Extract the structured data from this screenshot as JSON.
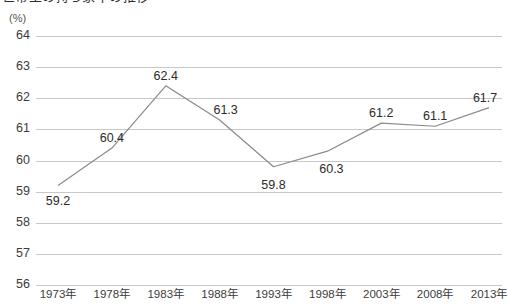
{
  "chart_title": "世帯主の持ち家率の推移",
  "axis_unit_label": "(%)",
  "chart_data": {
    "type": "line",
    "title": "世帯主の持ち家率の推移",
    "xlabel": "",
    "ylabel": "(%)",
    "categories": [
      "1973年",
      "1978年",
      "1983年",
      "1988年",
      "1993年",
      "1998年",
      "2003年",
      "2008年",
      "2013年"
    ],
    "values": [
      59.2,
      60.4,
      62.4,
      61.3,
      59.8,
      60.3,
      61.2,
      61.1,
      61.7
    ],
    "data_labels": [
      "59.2",
      "60.4",
      "62.4",
      "61.3",
      "59.8",
      "60.3",
      "61.2",
      "61.1",
      "61.7"
    ],
    "ylim": [
      56,
      64
    ],
    "ytick_labels": [
      "64",
      "63",
      "62",
      "61",
      "60",
      "59",
      "58",
      "57",
      "56"
    ],
    "ytick_values": [
      64,
      63,
      62,
      61,
      60,
      59,
      58,
      57,
      56
    ],
    "grid": true,
    "grid_axis": "y",
    "legend": "none",
    "series": [
      {
        "name": "持ち家率",
        "values": [
          59.2,
          60.4,
          62.4,
          61.3,
          59.8,
          60.3,
          61.2,
          61.1,
          61.7
        ]
      }
    ],
    "line_color": "#8a8a8a",
    "grid_color": "#c8c8c8",
    "text_color": "#3b3b3b"
  },
  "label_offsets": [
    {
      "dx": 0,
      "dy": 16
    },
    {
      "dx": 0,
      "dy": -10
    },
    {
      "dx": 0,
      "dy": -10
    },
    {
      "dx": 6,
      "dy": -10
    },
    {
      "dx": 0,
      "dy": 18
    },
    {
      "dx": 4,
      "dy": 18
    },
    {
      "dx": 0,
      "dy": -10
    },
    {
      "dx": 0,
      "dy": -10
    },
    {
      "dx": -4,
      "dy": -10
    }
  ]
}
